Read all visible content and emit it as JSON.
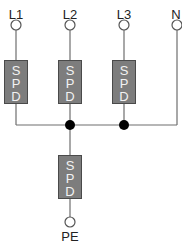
{
  "diagram": {
    "type": "spd-wiring",
    "colors": {
      "wire": "#6e6e6e",
      "spd_fill": "#7d7d7d",
      "spd_border": "#4a4a4a",
      "spd_text": "#f2f2f2",
      "junction": "#000000",
      "terminal_stroke": "#555555"
    },
    "terminals": [
      {
        "id": "L1",
        "label": "L1",
        "x": 16
      },
      {
        "id": "L2",
        "label": "L2",
        "x": 70
      },
      {
        "id": "L3",
        "label": "L3",
        "x": 124
      },
      {
        "id": "N",
        "label": "N",
        "x": 177
      }
    ],
    "spds": [
      {
        "id": "spd-l1",
        "letters": [
          "S",
          "P",
          "D"
        ]
      },
      {
        "id": "spd-l2",
        "letters": [
          "S",
          "P",
          "D"
        ]
      },
      {
        "id": "spd-l3",
        "letters": [
          "S",
          "P",
          "D"
        ]
      },
      {
        "id": "spd-pe",
        "letters": [
          "S",
          "P",
          "D"
        ]
      }
    ],
    "ground": {
      "label": "PE"
    }
  }
}
